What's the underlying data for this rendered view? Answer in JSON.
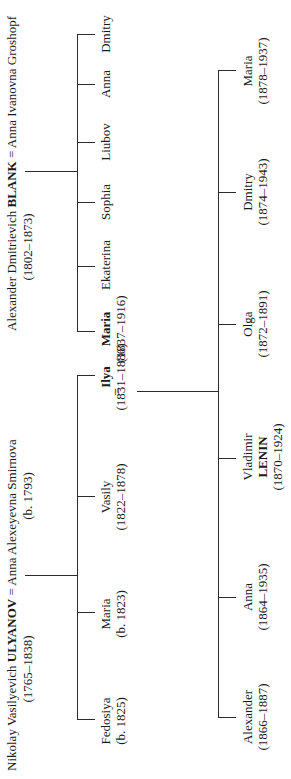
{
  "ulyanov_couple": {
    "husband_first": "Nikolay Vasilyevich ",
    "husband_surname": "ULYANOV",
    "husband_dates": "(1765–1838)",
    "marriage_sign": "=",
    "wife": "Anna Alexeyevna Smirnova",
    "wife_dates": "(b. 1793)"
  },
  "ulyanov_children": [
    {
      "name": "Fedosiya",
      "dates": "(b. 1825)",
      "bold": false
    },
    {
      "name": "Maria",
      "dates": "(b. 1823)",
      "bold": false
    },
    {
      "name": "Vasily",
      "dates": "(1822–1878)",
      "bold": false
    },
    {
      "name": "Ilya",
      "dates": "(1831–1886)",
      "bold": true
    }
  ],
  "blank_couple": {
    "husband_first": "Alexander Dmitrievich ",
    "husband_surname": "BLANK",
    "husband_dates": "(1802–1873)",
    "marriage_sign": "=",
    "wife": "Anna Ivanovna Groshopf"
  },
  "blank_children": [
    {
      "name": "Maria",
      "dates": "(1837–1916)",
      "bold": true
    },
    {
      "name": "Ekaterina",
      "dates": "",
      "bold": false
    },
    {
      "name": "Sophia",
      "dates": "",
      "bold": false
    },
    {
      "name": "Liubov",
      "dates": "",
      "bold": false
    },
    {
      "name": "Anna",
      "dates": "",
      "bold": false
    },
    {
      "name": "Dmitry",
      "dates": "",
      "bold": false
    }
  ],
  "marriage_ilya_maria": {
    "sign": "="
  },
  "lenin_siblings": [
    {
      "name": "Alexander",
      "surname": "",
      "dates": "(1866–1887)"
    },
    {
      "name": "Anna",
      "surname": "",
      "dates": "(1864–1935)"
    },
    {
      "name": "Vladimir",
      "surname": "LENIN",
      "dates": "(1870–1924)"
    },
    {
      "name": "Olga",
      "surname": "",
      "dates": "(1872–1891)"
    },
    {
      "name": "Dmitry",
      "surname": "",
      "dates": "(1874–1943)"
    },
    {
      "name": "Maria",
      "surname": "",
      "dates": "(1878–1937)"
    }
  ]
}
